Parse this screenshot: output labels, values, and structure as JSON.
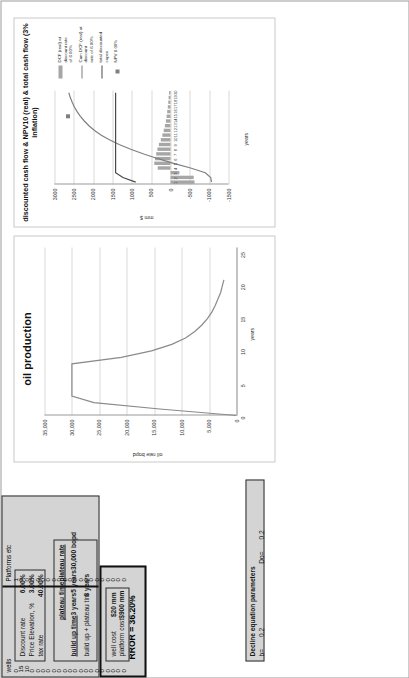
{
  "assumptions": {
    "rows": [
      {
        "label": "Discount rate",
        "value": "6.00%"
      },
      {
        "label": "Price Elevation, %",
        "value": "3.00%"
      },
      {
        "label": "tax rate",
        "value": "40.00%"
      }
    ]
  },
  "timing": {
    "headers": {
      "plateau_time": "plateau time",
      "plateau_rate": "plateau rate"
    },
    "rows": [
      {
        "label": "build up time",
        "value": "3 years",
        "value2": "5 years",
        "value3": "30,000 bopd"
      },
      {
        "label": "build up + plateau tim",
        "value": "8 years"
      }
    ],
    "buildup_label": "build up time",
    "buildup_value": "3 years",
    "plateau_time_value": "5 years",
    "plateau_rate_value": "30,000 bopd",
    "total_label": "build up + plateau tim",
    "total_value": "8 years"
  },
  "costs": {
    "rows": [
      {
        "label": "well cost",
        "value": "$20 mm"
      },
      {
        "label": "platform cost",
        "value": "$900 mm"
      }
    ]
  },
  "table": {
    "columns": [
      {
        "header": "wells",
        "values": [
          "0",
          "15",
          "10",
          "0",
          "0",
          "0",
          "0",
          "0",
          "0",
          "0",
          "0",
          "0",
          "0",
          "0",
          "0",
          "0",
          "0",
          "0",
          "0",
          "0",
          "0"
        ]
      },
      {
        "header": "Platforms etc",
        "values": [
          "1",
          "0",
          "0",
          "0",
          "0",
          "0",
          "0",
          "0",
          "0",
          "0",
          "0",
          "0",
          "0",
          "0",
          "0",
          "0",
          "0",
          "0",
          "0",
          "0",
          "0"
        ]
      }
    ]
  },
  "decline": {
    "title": "Decline equation parameters",
    "b_label": "b=",
    "b_value": "0.2",
    "do_label": "Do=",
    "do_value": "0.2"
  },
  "results": {
    "pi": "PI = 1.473",
    "rror": "RROR = 36.20%"
  },
  "chart_data": [
    {
      "type": "line",
      "title": "oil production",
      "xlabel": "years",
      "ylabel": "oil rate bopd",
      "ylim": [
        0,
        35000
      ],
      "xlim": [
        0,
        26
      ],
      "yticks": [
        "35,000",
        "30,000",
        "25,000",
        "20,000",
        "15,000",
        "10,000",
        "5,000",
        "0"
      ],
      "xticks": [
        "0",
        "5",
        "10",
        "15",
        "20",
        "25"
      ],
      "grid": true,
      "series": [
        {
          "name": "oil rate bopd",
          "x": [
            0,
            1,
            2,
            3,
            4,
            5,
            6,
            7,
            8,
            9,
            10,
            11,
            12,
            13,
            14,
            15,
            16,
            17,
            18,
            19,
            20,
            21
          ],
          "values": [
            0,
            14000,
            26000,
            30000,
            30000,
            30000,
            30000,
            30000,
            30000,
            21000,
            15500,
            11800,
            9300,
            7600,
            6300,
            5300,
            4500,
            3900,
            3400,
            2900,
            2600,
            2300
          ]
        }
      ]
    },
    {
      "type": "combo",
      "title": "discounted cash flow & NPV10 (real) & total cash flow\n(3% inflation)",
      "xlabel": "years",
      "ylabel": "mm $",
      "ylim": [
        -1500,
        3000
      ],
      "yticks": [
        "3000",
        "2500",
        "2000",
        "1500",
        "1000",
        "500",
        "0",
        "-500",
        "-1000",
        "-1500"
      ],
      "xticks": [
        "1",
        "2",
        "3",
        "4",
        "5",
        "6",
        "7",
        "8",
        "9",
        "10",
        "11",
        "12",
        "13",
        "14",
        "15",
        "16",
        "17",
        "18",
        "19",
        "20"
      ],
      "grid": true,
      "legend_position": "right",
      "legend": [
        {
          "key": "bar",
          "label": "DCF (real) at discount  rate\nof 6.00%"
        },
        {
          "key": "line1",
          "label": "Cum DCF (real) at discount\nrate of 6.00%"
        },
        {
          "key": "line2",
          "label": "total discounted capex"
        },
        {
          "key": "point",
          "label": "NPV 6.00%"
        }
      ],
      "series": [
        {
          "name": "DCF (real) at discount rate of 6.00%",
          "type": "bar",
          "x": [
            1,
            2,
            3,
            4,
            5,
            6,
            7,
            8,
            9,
            10,
            11,
            12,
            13,
            14,
            15,
            16,
            17,
            18,
            19,
            20
          ],
          "values": [
            -620,
            -600,
            -230,
            330,
            420,
            400,
            370,
            340,
            300,
            250,
            210,
            175,
            145,
            120,
            100,
            85,
            70,
            58,
            48,
            40
          ]
        },
        {
          "name": "Cum DCF (real) at discount rate of 6.00%",
          "type": "line",
          "x": [
            1,
            2,
            3,
            4,
            5,
            6,
            7,
            8,
            9,
            10,
            11,
            12,
            13,
            14,
            15,
            16,
            17,
            18,
            19,
            20
          ],
          "values": [
            -1060,
            -1040,
            -900,
            -520,
            -80,
            320,
            690,
            1030,
            1330,
            1580,
            1790,
            1965,
            2110,
            2230,
            2330,
            2415,
            2485,
            2543,
            2591,
            2631
          ]
        },
        {
          "name": "total discounted capex",
          "type": "line",
          "x": [
            1,
            2,
            3,
            4,
            5,
            6,
            7,
            8,
            9,
            10,
            11,
            12,
            13,
            14,
            15,
            16,
            17,
            18,
            19,
            20
          ],
          "values": [
            900,
            1230,
            1420,
            1420,
            1420,
            1420,
            1420,
            1420,
            1420,
            1420,
            1420,
            1420,
            1420,
            1420,
            1420,
            1420,
            1420,
            1420,
            1420,
            1420
          ]
        },
        {
          "name": "NPV 6.00%",
          "type": "point",
          "x": [
            15
          ],
          "values": [
            2650
          ]
        }
      ]
    }
  ]
}
